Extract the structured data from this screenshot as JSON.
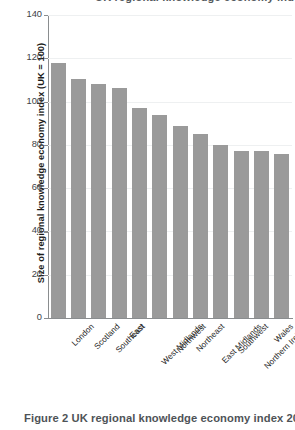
{
  "top_clipped_heading": "UK regional knowledge economy index",
  "caption": "Figure 2 UK regional knowledge economy index 201",
  "axis": {
    "ylabel": "Size of regional knowledge economy index (UK = 100)"
  },
  "chart_data": {
    "type": "bar",
    "title": "",
    "xlabel": "",
    "ylabel": "Size of regional knowledge economy index (UK = 100)",
    "ylim": [
      0,
      140
    ],
    "yticks": [
      0,
      20,
      40,
      60,
      80,
      100,
      120,
      140
    ],
    "ytick_labels": [
      "0",
      "20",
      "40",
      "60",
      "80",
      "100",
      "120",
      "140"
    ],
    "grid": true,
    "legend": null,
    "bar_color": "#9a9a9a",
    "categories": [
      "London",
      "Scotland",
      "Southeast",
      "East",
      "West Midlands",
      "Northwest",
      "Northeast",
      "East Midlands",
      "Southwest",
      "Northern Ireland",
      "Wales",
      "Yorkshire and Humber"
    ],
    "values": [
      118,
      110.5,
      108,
      106.5,
      97,
      94,
      88.5,
      85,
      80,
      77,
      77,
      76
    ]
  }
}
